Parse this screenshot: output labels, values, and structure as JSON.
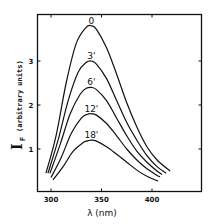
{
  "chart_data": {
    "type": "line",
    "title": "",
    "xlabel": "λ (nm)",
    "ylabel": "I_F (arbitrary units)",
    "ylabel_symbol": "I",
    "ylabel_subscript": "F",
    "ylabel_units": "(arbitrary units)",
    "xlim": [
      286,
      450
    ],
    "ylim": [
      0,
      4.0
    ],
    "x_ticks": [
      300,
      350,
      400
    ],
    "x_tick_labels": [
      "300",
      "350",
      "400"
    ],
    "y_ticks": [
      1,
      2,
      3
    ],
    "y_tick_labels": [
      "1",
      "2",
      "3"
    ],
    "grid": false,
    "legend": "inline labels above each curve peak",
    "line_color": "#111111",
    "series": [
      {
        "name": "0",
        "label": "0",
        "peak_x": 340,
        "peak_y": 3.8,
        "x": [
          295,
          305,
          315,
          325,
          335,
          340,
          345,
          355,
          365,
          375,
          385,
          395,
          405,
          418
        ],
        "y": [
          0.45,
          1.3,
          2.5,
          3.4,
          3.77,
          3.8,
          3.72,
          3.3,
          2.7,
          2.05,
          1.5,
          1.05,
          0.75,
          0.5
        ]
      },
      {
        "name": "3'",
        "label": "3'",
        "peak_x": 340,
        "peak_y": 3.0,
        "x": [
          297,
          307,
          317,
          327,
          335,
          340,
          345,
          355,
          365,
          375,
          385,
          395,
          405,
          414
        ],
        "y": [
          0.45,
          1.2,
          2.1,
          2.75,
          2.97,
          3.0,
          2.93,
          2.6,
          2.1,
          1.6,
          1.2,
          0.85,
          0.6,
          0.45
        ]
      },
      {
        "name": "6'",
        "label": "6'",
        "peak_x": 340,
        "peak_y": 2.4,
        "x": [
          299,
          309,
          319,
          329,
          335,
          340,
          345,
          355,
          365,
          375,
          385,
          395,
          405,
          410
        ],
        "y": [
          0.45,
          1.1,
          1.8,
          2.25,
          2.38,
          2.4,
          2.35,
          2.1,
          1.7,
          1.3,
          0.95,
          0.7,
          0.5,
          0.42
        ]
      },
      {
        "name": "12'",
        "label": "12'",
        "peak_x": 340,
        "peak_y": 1.8,
        "x": [
          300,
          310,
          320,
          330,
          336,
          340,
          345,
          355,
          365,
          375,
          385,
          395,
          405,
          408
        ],
        "y": [
          0.35,
          0.8,
          1.35,
          1.7,
          1.79,
          1.8,
          1.77,
          1.58,
          1.3,
          1.0,
          0.75,
          0.55,
          0.4,
          0.37
        ]
      },
      {
        "name": "18'",
        "label": "18'",
        "peak_x": 340,
        "peak_y": 1.2,
        "x": [
          302,
          312,
          322,
          332,
          337,
          340,
          345,
          355,
          365,
          375,
          385,
          395,
          406
        ],
        "y": [
          0.3,
          0.6,
          0.95,
          1.15,
          1.19,
          1.2,
          1.18,
          1.05,
          0.88,
          0.7,
          0.52,
          0.38,
          0.27
        ]
      }
    ]
  }
}
